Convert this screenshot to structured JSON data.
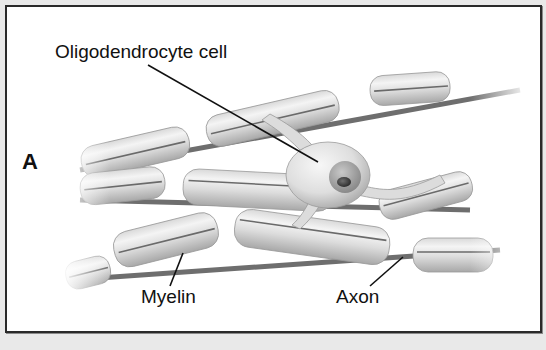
{
  "figure": {
    "panel_letter": "A",
    "labels": {
      "oligodendrocyte": "Oligodendrocyte cell",
      "myelin": "Myelin",
      "axon": "Axon"
    },
    "colors": {
      "background": "#e9e9e9",
      "panel": "#ffffff",
      "border": "#2a2a2a",
      "sheath_light": "#f2f2f2",
      "sheath_dark": "#a9a9a9",
      "axon_node": "#6e6e6e",
      "nucleus": "#8c8c8c",
      "nucleolus": "#3a3a3a",
      "text": "#111111"
    }
  }
}
